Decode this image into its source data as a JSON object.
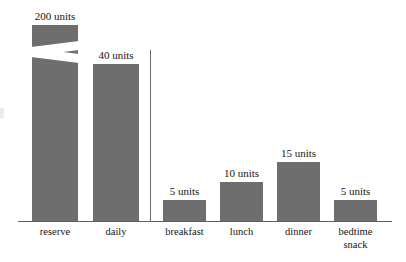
{
  "chart_data": {
    "type": "bar",
    "title": "",
    "subtitle": "",
    "xlabel": "",
    "ylabel": "",
    "grid": false,
    "legend": "none",
    "axis_break": {
      "present": true,
      "series_index": 0,
      "category": "reserve",
      "note": "zigzag scale break drawn across the reserve bar"
    },
    "groups": [
      {
        "name": "supply",
        "categories": [
          "reserve",
          "daily"
        ]
      },
      {
        "name": "intake",
        "categories": [
          "breakfast",
          "lunch",
          "dinner",
          "bedtime snack"
        ]
      }
    ],
    "categories": [
      "reserve",
      "daily",
      "breakfast",
      "lunch",
      "dinner",
      "bedtime snack"
    ],
    "values": [
      200,
      40,
      5,
      10,
      15,
      5
    ],
    "value_labels": [
      "200 units",
      "40 units",
      "5 units",
      "10 units",
      "15 units",
      "5 units"
    ],
    "unit": "units"
  },
  "bars": [
    {
      "label": "reserve",
      "value": 200,
      "value_label": "200 units",
      "left": 32,
      "width": 46,
      "top": 25,
      "height": 196,
      "broken": true,
      "label_left": 21,
      "label_top": 10,
      "label_width": 68
    },
    {
      "label": "daily",
      "value": 40,
      "value_label": "40 units",
      "left": 93,
      "width": 46,
      "top": 64,
      "height": 157,
      "broken": false,
      "label_left": 82,
      "label_top": 49,
      "label_width": 68
    },
    {
      "label": "breakfast",
      "value": 5,
      "value_label": "5 units",
      "left": 163,
      "width": 43,
      "top": 200,
      "height": 21,
      "broken": false,
      "label_left": 152,
      "label_top": 185,
      "label_width": 65
    },
    {
      "label": "lunch",
      "value": 10,
      "value_label": "10 units",
      "left": 220,
      "width": 43,
      "top": 182,
      "height": 39,
      "broken": false,
      "label_left": 209,
      "label_top": 167,
      "label_width": 65
    },
    {
      "label": "dinner",
      "value": 15,
      "value_label": "15 units",
      "left": 277,
      "width": 43,
      "top": 162,
      "height": 59,
      "broken": false,
      "label_left": 266,
      "label_top": 147,
      "label_width": 65
    },
    {
      "label": "bedtime snack",
      "value": 5,
      "value_label": "5 units",
      "left": 334,
      "width": 43,
      "top": 200,
      "height": 21,
      "broken": false,
      "label_left": 323,
      "label_top": 185,
      "label_width": 65
    }
  ],
  "category_labels": [
    {
      "text": "reserve",
      "left": 21,
      "width": 68
    },
    {
      "text": "daily",
      "left": 82,
      "width": 68
    },
    {
      "text": "breakfast",
      "left": 150,
      "width": 69
    },
    {
      "text": "lunch",
      "left": 207,
      "width": 69
    },
    {
      "text": "dinner",
      "left": 264,
      "width": 69
    },
    {
      "text": "bedtime\nsnack",
      "left": 321,
      "width": 69
    }
  ],
  "colors": {
    "bar_fill": "#6e6e6e",
    "axis": "#5d5d5d",
    "divider": "#6a6a6a",
    "text": "#141414",
    "background": "#ffffff"
  }
}
